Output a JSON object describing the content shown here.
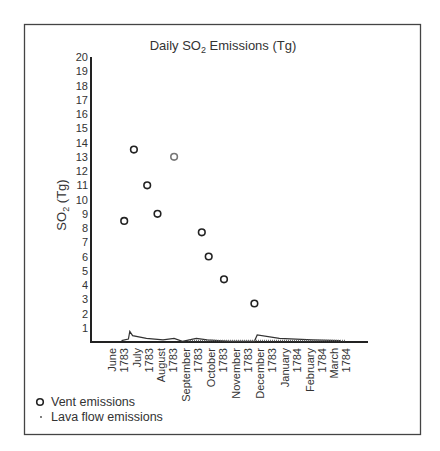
{
  "chart_data": {
    "type": "scatter",
    "title": "Daily SO2 Emissions (Tg)",
    "title_parts": {
      "prefix": "Daily SO",
      "sub": "2",
      "suffix": " Emissions (Tg)"
    },
    "xlabel": "",
    "ylabel": "SO2 (Tg)",
    "ylabel_parts": {
      "prefix": "SO",
      "sub": "2",
      "suffix": " (Tg)"
    },
    "ylim": [
      0,
      20
    ],
    "yticks": [
      1,
      2,
      3,
      4,
      5,
      6,
      7,
      8,
      9,
      10,
      11,
      12,
      13,
      14,
      15,
      16,
      17,
      18,
      19,
      20
    ],
    "grid": false,
    "legend_position": "bottom-left",
    "x_categories": [
      {
        "month": "June",
        "year": "1783"
      },
      {
        "month": "July",
        "year": "1783"
      },
      {
        "month": "August",
        "year": "1783"
      },
      {
        "month": "September",
        "year": "1783"
      },
      {
        "month": "October",
        "year": "1783"
      },
      {
        "month": "November",
        "year": "1783"
      },
      {
        "month": "December",
        "year": "1783"
      },
      {
        "month": "January",
        "year": "1784"
      },
      {
        "month": "February",
        "year": "1784"
      },
      {
        "month": "March",
        "year": "1784"
      }
    ],
    "series": [
      {
        "name": "Vent emissions",
        "marker": "open-circle",
        "color": "#222222",
        "points": [
          {
            "x": "early June 1783",
            "xfrac": 0.12,
            "y": 8.5
          },
          {
            "x": "mid June 1783",
            "xfrac": 0.155,
            "y": 13.5
          },
          {
            "x": "early July 1783",
            "xfrac": 0.203,
            "y": 11.0
          },
          {
            "x": "mid July 1783",
            "xfrac": 0.24,
            "y": 9.0
          },
          {
            "x": "late July 1783",
            "xfrac": 0.3,
            "y": 13.0,
            "color": "#777777"
          },
          {
            "x": "late August 1783",
            "xfrac": 0.4,
            "y": 7.7
          },
          {
            "x": "early September 1783",
            "xfrac": 0.425,
            "y": 6.0
          },
          {
            "x": "mid September 1783",
            "xfrac": 0.48,
            "y": 4.4
          },
          {
            "x": "mid October 1783",
            "xfrac": 0.59,
            "y": 2.7
          }
        ]
      },
      {
        "name": "Lava flow emissions",
        "marker": "dot",
        "color": "#222222",
        "points": [
          {
            "xfrac": 0.11,
            "y": 0.1
          },
          {
            "xfrac": 0.135,
            "y": 0.2
          },
          {
            "xfrac": 0.14,
            "y": 0.75
          },
          {
            "xfrac": 0.15,
            "y": 0.45
          },
          {
            "xfrac": 0.2,
            "y": 0.25
          },
          {
            "xfrac": 0.26,
            "y": 0.15
          },
          {
            "xfrac": 0.3,
            "y": 0.25
          },
          {
            "xfrac": 0.33,
            "y": 0.05
          },
          {
            "xfrac": 0.38,
            "y": 0.25
          },
          {
            "xfrac": 0.42,
            "y": 0.15
          },
          {
            "xfrac": 0.5,
            "y": 0.05
          },
          {
            "xfrac": 0.59,
            "y": 0.05
          },
          {
            "xfrac": 0.6,
            "y": 0.5
          },
          {
            "xfrac": 0.68,
            "y": 0.25
          },
          {
            "xfrac": 0.8,
            "y": 0.15
          },
          {
            "xfrac": 0.9,
            "y": 0.1
          }
        ]
      }
    ]
  },
  "legend": {
    "items": [
      {
        "label": "Vent emissions",
        "marker": "open-circle"
      },
      {
        "label": "Lava flow emissions",
        "marker": "dot"
      }
    ]
  }
}
